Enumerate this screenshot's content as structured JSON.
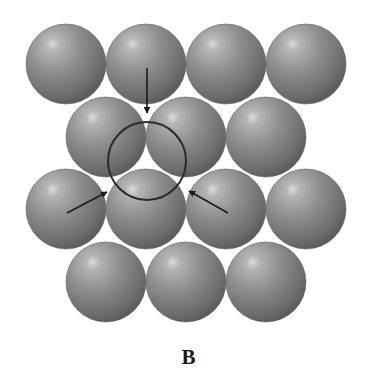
{
  "figure": {
    "caption": "B",
    "sphere_radius": 40,
    "colors": {
      "background": "#ffffff",
      "sphere_highlight": "#d8d8d8",
      "sphere_mid": "#8c8c8c",
      "sphere_edge": "#5c5c5c",
      "outline": "#3a3a3a",
      "arrow": "#1a1a1a",
      "circle": "#2a2a2a"
    },
    "rows": [
      {
        "cy": 64,
        "cx": [
          66,
          146,
          226,
          306
        ]
      },
      {
        "cy": 137,
        "cx": [
          106,
          186,
          266
        ]
      },
      {
        "cy": 209,
        "cx": [
          66,
          146,
          226,
          306
        ]
      },
      {
        "cy": 282,
        "cx": [
          106,
          186,
          266
        ]
      }
    ],
    "highlight_circle": {
      "cx": 147,
      "cy": 161,
      "r": 39
    },
    "arrows": [
      {
        "name": "arrow-down",
        "x1": 147,
        "y1": 68,
        "x2": 147,
        "y2": 113
      },
      {
        "name": "arrow-left",
        "x1": 67,
        "y1": 213,
        "x2": 107,
        "y2": 192
      },
      {
        "name": "arrow-right",
        "x1": 228,
        "y1": 213,
        "x2": 189,
        "y2": 191
      }
    ]
  }
}
